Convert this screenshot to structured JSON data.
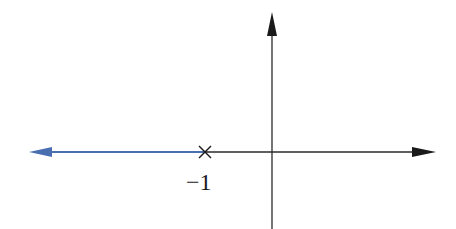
{
  "diagram": {
    "type": "root-locus",
    "colors": {
      "axis": "#1a1a1a",
      "locus": "#4a6fb0",
      "background": "#ffffff"
    },
    "axes": {
      "real_axis": {
        "direction": "right",
        "has_arrow": true
      },
      "imag_axis": {
        "direction": "up",
        "has_arrow": true
      }
    },
    "poles": [
      {
        "value": -1,
        "marker": "×",
        "label": "−1"
      }
    ],
    "locus_branches": [
      {
        "from": -1,
        "to": "-infinity",
        "direction": "left"
      }
    ]
  }
}
